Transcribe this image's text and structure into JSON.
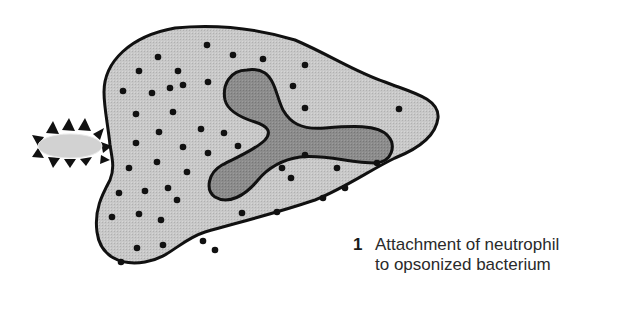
{
  "figure": {
    "step_number": "1",
    "caption_line1": "Attachment of neutrophil",
    "caption_line2": "to opsonized bacterium",
    "labels": {
      "cell": "neutrophil",
      "nucleus": "multilobed nucleus",
      "granules": "cytoplasmic granules",
      "bacterium": "opsonized bacterium"
    },
    "colors": {
      "cytoplasm": "#c4c4c4",
      "nucleus": "#8a8a8a",
      "bacterium_body": "#cfcfcf",
      "outline": "#111111",
      "granule": "#111111",
      "opsonin_spike": "#111111",
      "caption_text": "#2a2a2a"
    }
  }
}
